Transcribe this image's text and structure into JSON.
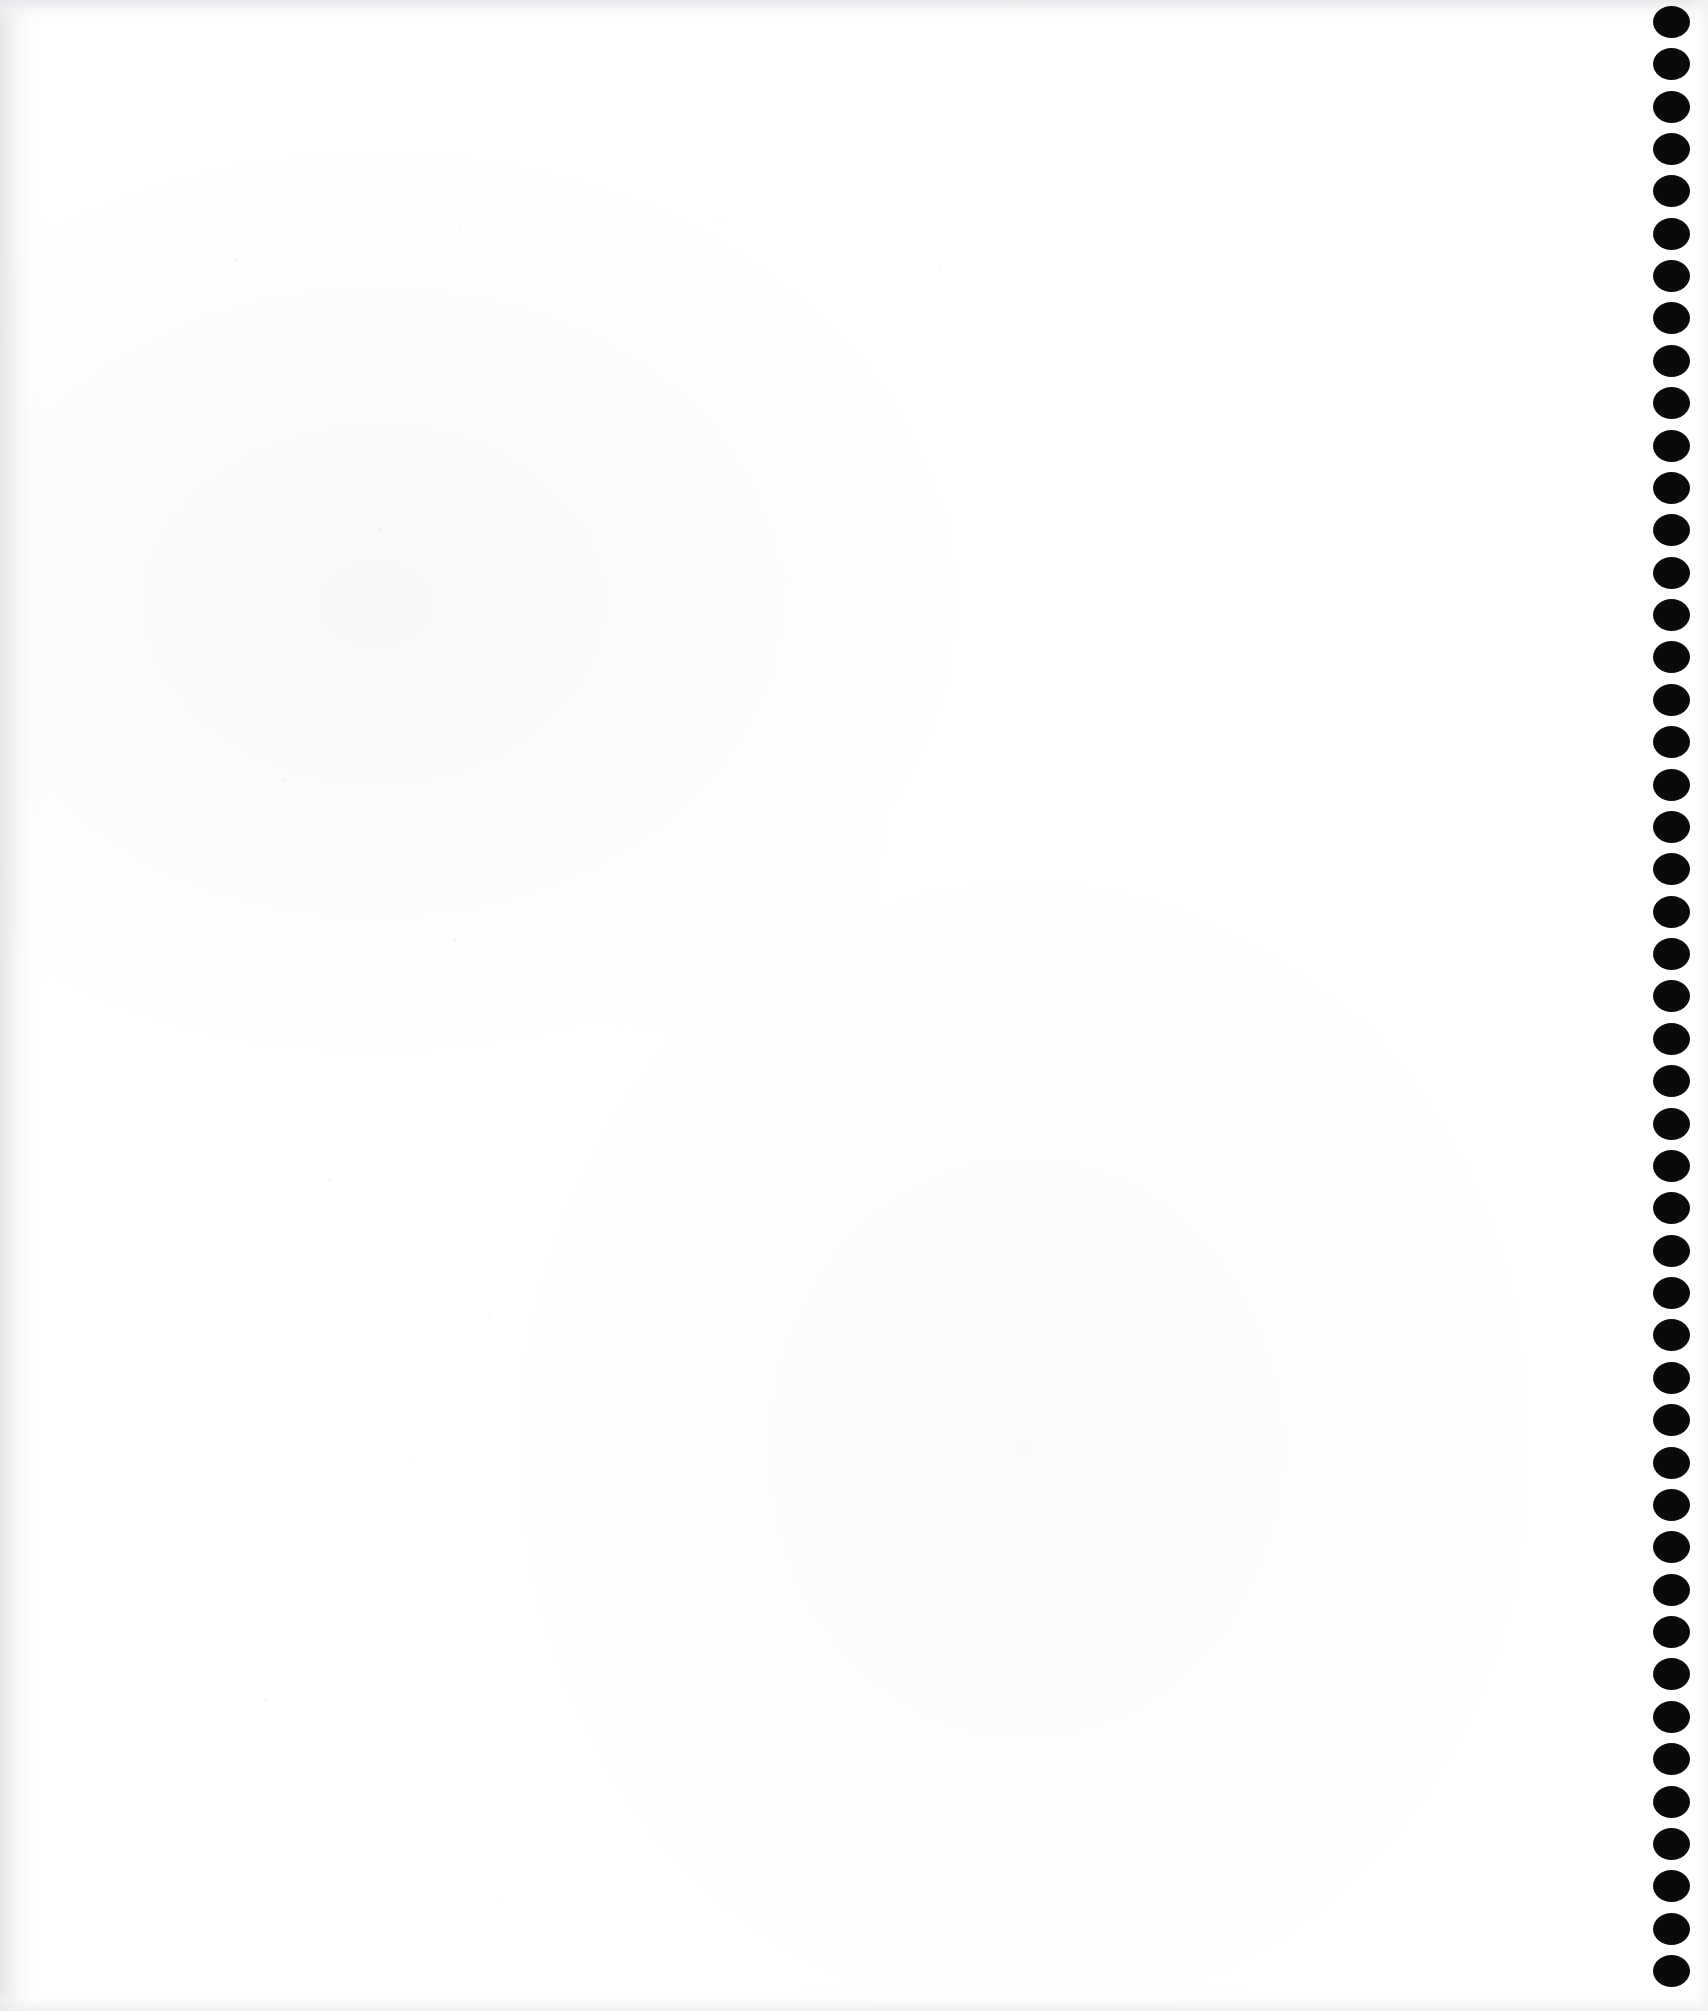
{
  "document": {
    "kind": "scanned-page",
    "page_state": "blank",
    "visible_text": "",
    "page_width_px": 1708,
    "page_height_px": 2011,
    "background_color": "#ffffff",
    "paper_tint_color": "#f7f7f9"
  },
  "binding": {
    "name": "spiral-binding-hole-column",
    "edge": "right",
    "hole_color": "#0a0a0a",
    "hole_count": 47,
    "hole_width_px": 37,
    "hole_height_px": 32,
    "first_hole_center_y_px": 22,
    "hole_spacing_px": 42.4,
    "hole_center_x_px": 1671,
    "holes": [
      {
        "index": 1,
        "cx": 1671,
        "cy": 22
      },
      {
        "index": 2,
        "cx": 1671,
        "cy": 64
      },
      {
        "index": 3,
        "cx": 1671,
        "cy": 107
      },
      {
        "index": 4,
        "cx": 1671,
        "cy": 149
      },
      {
        "index": 5,
        "cx": 1671,
        "cy": 191
      },
      {
        "index": 6,
        "cx": 1671,
        "cy": 234
      },
      {
        "index": 7,
        "cx": 1671,
        "cy": 276
      },
      {
        "index": 8,
        "cx": 1671,
        "cy": 318
      },
      {
        "index": 9,
        "cx": 1671,
        "cy": 361
      },
      {
        "index": 10,
        "cx": 1671,
        "cy": 403
      },
      {
        "index": 11,
        "cx": 1671,
        "cy": 446
      },
      {
        "index": 12,
        "cx": 1671,
        "cy": 488
      },
      {
        "index": 13,
        "cx": 1671,
        "cy": 530
      },
      {
        "index": 14,
        "cx": 1671,
        "cy": 573
      },
      {
        "index": 15,
        "cx": 1671,
        "cy": 615
      },
      {
        "index": 16,
        "cx": 1671,
        "cy": 657
      },
      {
        "index": 17,
        "cx": 1671,
        "cy": 700
      },
      {
        "index": 18,
        "cx": 1671,
        "cy": 742
      },
      {
        "index": 19,
        "cx": 1671,
        "cy": 785
      },
      {
        "index": 20,
        "cx": 1671,
        "cy": 827
      },
      {
        "index": 21,
        "cx": 1671,
        "cy": 869
      },
      {
        "index": 22,
        "cx": 1671,
        "cy": 912
      },
      {
        "index": 23,
        "cx": 1671,
        "cy": 954
      },
      {
        "index": 24,
        "cx": 1671,
        "cy": 996
      },
      {
        "index": 25,
        "cx": 1671,
        "cy": 1039
      },
      {
        "index": 26,
        "cx": 1671,
        "cy": 1081
      },
      {
        "index": 27,
        "cx": 1671,
        "cy": 1124
      },
      {
        "index": 28,
        "cx": 1671,
        "cy": 1166
      },
      {
        "index": 29,
        "cx": 1671,
        "cy": 1208
      },
      {
        "index": 30,
        "cx": 1671,
        "cy": 1251
      },
      {
        "index": 31,
        "cx": 1671,
        "cy": 1293
      },
      {
        "index": 32,
        "cx": 1671,
        "cy": 1335
      },
      {
        "index": 33,
        "cx": 1671,
        "cy": 1378
      },
      {
        "index": 34,
        "cx": 1671,
        "cy": 1420
      },
      {
        "index": 35,
        "cx": 1671,
        "cy": 1463
      },
      {
        "index": 36,
        "cx": 1671,
        "cy": 1505
      },
      {
        "index": 37,
        "cx": 1671,
        "cy": 1547
      },
      {
        "index": 38,
        "cx": 1671,
        "cy": 1590
      },
      {
        "index": 39,
        "cx": 1671,
        "cy": 1632
      },
      {
        "index": 40,
        "cx": 1671,
        "cy": 1674
      },
      {
        "index": 41,
        "cx": 1671,
        "cy": 1717
      },
      {
        "index": 42,
        "cx": 1671,
        "cy": 1759
      },
      {
        "index": 43,
        "cx": 1671,
        "cy": 1802
      },
      {
        "index": 44,
        "cx": 1671,
        "cy": 1844
      },
      {
        "index": 45,
        "cx": 1671,
        "cy": 1886
      },
      {
        "index": 46,
        "cx": 1671,
        "cy": 1929
      },
      {
        "index": 47,
        "cx": 1671,
        "cy": 1971
      }
    ]
  },
  "speckles": [
    {
      "x": 155,
      "y": 200,
      "r": 1.6,
      "o": 0.22
    },
    {
      "x": 380,
      "y": 170,
      "r": 1.2,
      "o": 0.18
    },
    {
      "x": 640,
      "y": 160,
      "r": 1.4,
      "o": 0.2
    },
    {
      "x": 520,
      "y": 295,
      "r": 1.1,
      "o": 0.16
    },
    {
      "x": 860,
      "y": 210,
      "r": 1.3,
      "o": 0.15
    },
    {
      "x": 975,
      "y": 330,
      "r": 1.0,
      "o": 0.14
    },
    {
      "x": 300,
      "y": 470,
      "r": 1.5,
      "o": 0.19
    },
    {
      "x": 710,
      "y": 520,
      "r": 1.2,
      "o": 0.17
    },
    {
      "x": 1120,
      "y": 430,
      "r": 1.1,
      "o": 0.13
    },
    {
      "x": 450,
      "y": 640,
      "r": 1.3,
      "o": 0.18
    },
    {
      "x": 1260,
      "y": 610,
      "r": 1.0,
      "o": 0.12
    },
    {
      "x": 205,
      "y": 720,
      "r": 1.4,
      "o": 0.2
    },
    {
      "x": 890,
      "y": 760,
      "r": 1.1,
      "o": 0.14
    },
    {
      "x": 375,
      "y": 880,
      "r": 1.6,
      "o": 0.21
    },
    {
      "x": 600,
      "y": 890,
      "r": 1.2,
      "o": 0.17
    },
    {
      "x": 1055,
      "y": 880,
      "r": 1.0,
      "o": 0.13
    },
    {
      "x": 680,
      "y": 1010,
      "r": 1.3,
      "o": 0.16
    },
    {
      "x": 475,
      "y": 1020,
      "r": 1.1,
      "o": 0.15
    },
    {
      "x": 1180,
      "y": 1060,
      "r": 1.2,
      "o": 0.13
    },
    {
      "x": 250,
      "y": 1120,
      "r": 1.4,
      "o": 0.18
    },
    {
      "x": 815,
      "y": 1160,
      "r": 1.0,
      "o": 0.14
    },
    {
      "x": 410,
      "y": 1255,
      "r": 1.5,
      "o": 0.2
    },
    {
      "x": 1010,
      "y": 1290,
      "r": 1.1,
      "o": 0.13
    },
    {
      "x": 330,
      "y": 1400,
      "r": 1.3,
      "o": 0.17
    },
    {
      "x": 735,
      "y": 1430,
      "r": 1.2,
      "o": 0.15
    },
    {
      "x": 1265,
      "y": 1410,
      "r": 1.0,
      "o": 0.12
    },
    {
      "x": 560,
      "y": 1540,
      "r": 1.4,
      "o": 0.18
    },
    {
      "x": 940,
      "y": 1570,
      "r": 1.1,
      "o": 0.14
    },
    {
      "x": 185,
      "y": 1640,
      "r": 1.5,
      "o": 0.2
    },
    {
      "x": 1100,
      "y": 1690,
      "r": 1.0,
      "o": 0.12
    },
    {
      "x": 640,
      "y": 1760,
      "r": 1.3,
      "o": 0.16
    },
    {
      "x": 420,
      "y": 1840,
      "r": 1.2,
      "o": 0.15
    },
    {
      "x": 880,
      "y": 1890,
      "r": 1.1,
      "o": 0.13
    },
    {
      "x": 1210,
      "y": 1860,
      "r": 1.0,
      "o": 0.12
    },
    {
      "x": 305,
      "y": 1930,
      "r": 1.3,
      "o": 0.16
    }
  ]
}
